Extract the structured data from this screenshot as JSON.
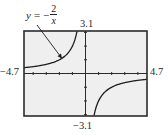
{
  "chart_data": {
    "type": "line",
    "title": "",
    "function_label": {
      "lhs": "y",
      "equals": "=",
      "sign": "−",
      "numerator": "2",
      "denominator": "x"
    },
    "equation": "y = -2/x",
    "xlabel": "",
    "ylabel": "",
    "xlim": [
      -4.7,
      4.7
    ],
    "ylim": [
      -3.1,
      3.1
    ],
    "x_tick_step": 1,
    "y_tick_step": 1,
    "grid": false,
    "legend": "none",
    "window_labels": {
      "xmin": "−4.7",
      "xmax": "4.7",
      "ymax": "3.1",
      "ymin": "−3.1"
    },
    "series": [
      {
        "name": "y = -2/x (x < 0 branch)",
        "x": [
          -4.7,
          -4.0,
          -3.0,
          -2.0,
          -1.5,
          -1.0,
          -0.8,
          -0.65
        ],
        "y": [
          0.43,
          0.5,
          0.67,
          1.0,
          1.33,
          2.0,
          2.5,
          3.08
        ]
      },
      {
        "name": "y = -2/x (x > 0 branch)",
        "x": [
          0.65,
          0.8,
          1.0,
          1.5,
          2.0,
          3.0,
          4.0,
          4.7
        ],
        "y": [
          -3.08,
          -2.5,
          -2.0,
          -1.33,
          -1.0,
          -0.67,
          -0.5,
          -0.43
        ]
      }
    ],
    "annotations": [
      {
        "text": "y = -2/x",
        "arrow_to": {
          "x": -1.8,
          "y": 1.1
        }
      }
    ]
  },
  "colors": {
    "frame": "#2b2b2b",
    "screen_bg": "#efefef",
    "curve": "#1e1e1e",
    "text": "#2a2a2a"
  }
}
